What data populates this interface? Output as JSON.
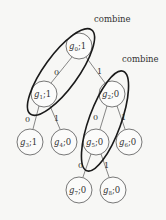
{
  "diagram": {
    "type": "binary-tree",
    "nodes": [
      {
        "id": "g0",
        "name": "g",
        "sub": "0",
        "value": "1",
        "cx": 79,
        "cy": 46
      },
      {
        "id": "g1",
        "name": "g",
        "sub": "1",
        "value": "1",
        "cx": 44,
        "cy": 94
      },
      {
        "id": "g2",
        "name": "g",
        "sub": "2",
        "value": "0",
        "cx": 112,
        "cy": 94
      },
      {
        "id": "g3",
        "name": "g",
        "sub": "3",
        "value": "1",
        "cx": 30,
        "cy": 142
      },
      {
        "id": "g4",
        "name": "g",
        "sub": "4",
        "value": "0",
        "cx": 64,
        "cy": 142
      },
      {
        "id": "g5",
        "name": "g",
        "sub": "5",
        "value": "0",
        "cx": 96,
        "cy": 142
      },
      {
        "id": "g6",
        "name": "g",
        "sub": "6",
        "value": "0",
        "cx": 129,
        "cy": 142
      },
      {
        "id": "g7",
        "name": "g",
        "sub": "7",
        "value": "0",
        "cx": 79,
        "cy": 190
      },
      {
        "id": "g8",
        "name": "g",
        "sub": "8",
        "value": "0",
        "cx": 113,
        "cy": 190
      }
    ],
    "edges": [
      {
        "from": "g0",
        "to": "g1",
        "label": "0"
      },
      {
        "from": "g0",
        "to": "g2",
        "label": "1"
      },
      {
        "from": "g1",
        "to": "g3",
        "label": "0"
      },
      {
        "from": "g1",
        "to": "g4",
        "label": "1"
      },
      {
        "from": "g2",
        "to": "g5",
        "label": "0"
      },
      {
        "from": "g2",
        "to": "g6",
        "label": "1"
      },
      {
        "from": "g5",
        "to": "g7",
        "label": "0"
      },
      {
        "from": "g5",
        "to": "g8",
        "label": "1"
      }
    ],
    "groups": [
      {
        "label": "combine",
        "members": [
          "g0",
          "g1"
        ]
      },
      {
        "label": "combine",
        "members": [
          "g2",
          "g5"
        ]
      }
    ],
    "separator": ";"
  }
}
